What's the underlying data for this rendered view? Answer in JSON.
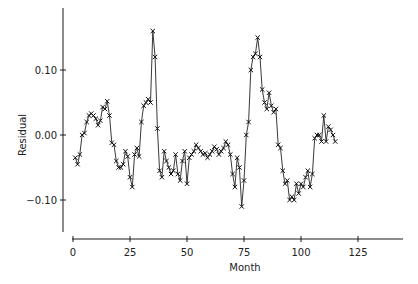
{
  "chart_data": {
    "type": "line",
    "title": "",
    "xlabel": "Month",
    "ylabel": "Residual",
    "xlim": [
      0,
      145
    ],
    "ylim": [
      -0.15,
      0.2
    ],
    "xticks": [
      0,
      25,
      50,
      75,
      100,
      125
    ],
    "xtick_labels": [
      "0",
      "25",
      "50",
      "75",
      "100",
      "125"
    ],
    "yticks": [
      -0.1,
      0.0,
      0.1
    ],
    "ytick_labels": [
      "−0.10",
      "0.00",
      "0.10"
    ],
    "grid": false,
    "legend": "none",
    "marker": "x",
    "series": [
      {
        "name": "Residual",
        "x": [
          1,
          2,
          3,
          4,
          5,
          6,
          7,
          8,
          9,
          10,
          11,
          12,
          13,
          14,
          15,
          16,
          17,
          18,
          19,
          20,
          21,
          22,
          23,
          24,
          25,
          26,
          27,
          28,
          29,
          30,
          31,
          32,
          33,
          34,
          35,
          36,
          37,
          38,
          39,
          40,
          41,
          42,
          43,
          44,
          45,
          46,
          47,
          48,
          49,
          50,
          51,
          52,
          53,
          54,
          55,
          56,
          57,
          58,
          59,
          60,
          61,
          62,
          63,
          64,
          65,
          66,
          67,
          68,
          69,
          70,
          71,
          72,
          73,
          74,
          75,
          76,
          77,
          78,
          79,
          80,
          81,
          82,
          83,
          84,
          85,
          86,
          87,
          88,
          89,
          90,
          91,
          92,
          93,
          94,
          95,
          96,
          97,
          98,
          99,
          100,
          101,
          102,
          103,
          104,
          105,
          106,
          107,
          108,
          109,
          110,
          111,
          112,
          113,
          114,
          115
        ],
        "values": [
          -0.035,
          -0.045,
          -0.03,
          0.0,
          0.003,
          0.02,
          0.03,
          0.033,
          0.03,
          0.025,
          0.015,
          0.022,
          0.043,
          0.04,
          0.052,
          0.03,
          -0.012,
          -0.015,
          -0.04,
          -0.05,
          -0.05,
          -0.045,
          -0.025,
          -0.033,
          -0.065,
          -0.08,
          -0.03,
          -0.02,
          -0.033,
          0.02,
          0.045,
          0.05,
          0.055,
          0.05,
          0.16,
          0.12,
          0.01,
          -0.055,
          -0.065,
          -0.025,
          -0.04,
          -0.05,
          -0.06,
          -0.055,
          -0.03,
          -0.06,
          -0.07,
          -0.04,
          -0.025,
          -0.075,
          -0.035,
          -0.03,
          -0.025,
          -0.015,
          -0.02,
          -0.025,
          -0.03,
          -0.028,
          -0.035,
          -0.03,
          -0.025,
          -0.018,
          -0.022,
          -0.03,
          -0.025,
          -0.02,
          -0.01,
          -0.015,
          -0.03,
          -0.06,
          -0.08,
          -0.035,
          -0.05,
          -0.11,
          -0.07,
          0.0,
          0.02,
          0.1,
          0.12,
          0.125,
          0.15,
          0.12,
          0.07,
          0.05,
          0.04,
          0.065,
          0.045,
          0.035,
          0.04,
          -0.015,
          -0.02,
          -0.055,
          -0.075,
          -0.07,
          -0.1,
          -0.095,
          -0.1,
          -0.075,
          -0.09,
          -0.075,
          -0.08,
          -0.065,
          -0.055,
          -0.08,
          -0.06,
          -0.005,
          0.0,
          0.0,
          -0.01,
          0.03,
          -0.01,
          0.013,
          0.008,
          0.0,
          -0.01
        ]
      }
    ]
  }
}
